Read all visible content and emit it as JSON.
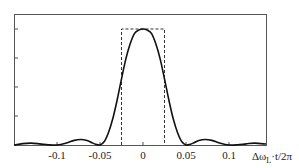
{
  "chart_data": {
    "type": "line",
    "title": "",
    "xlabel": "Δω_L·t/2π",
    "ylabel": "",
    "xlim": [
      -0.15,
      0.143
    ],
    "ylim": [
      0,
      1.15
    ],
    "x_ticks": [
      -0.1,
      -0.05,
      0,
      0.05,
      0.1
    ],
    "x_tick_labels": [
      "-0.1",
      "-0.05",
      "0",
      "0.05",
      "0.1"
    ],
    "y_ticks": [
      0.25,
      0.5,
      0.75,
      1.0
    ],
    "y_tick_labels": [
      "",
      "",
      "",
      ""
    ],
    "grid": false,
    "legend": null,
    "series": [
      {
        "name": "spectrum (sinc²)",
        "style": "solid",
        "color": "#111111",
        "x": [
          -0.15,
          -0.14,
          -0.13,
          -0.12,
          -0.11,
          -0.1,
          -0.09,
          -0.08,
          -0.072,
          -0.065,
          -0.06,
          -0.055,
          -0.05,
          -0.045,
          -0.04,
          -0.035,
          -0.03,
          -0.025,
          -0.02,
          -0.015,
          -0.01,
          -0.005,
          0,
          0.005,
          0.01,
          0.015,
          0.02,
          0.025,
          0.03,
          0.035,
          0.04,
          0.045,
          0.05,
          0.055,
          0.06,
          0.065,
          0.072,
          0.08,
          0.09,
          0.1,
          0.11,
          0.12,
          0.13,
          0.143
        ],
        "y": [
          0.0,
          0.012,
          0.016,
          0.01,
          0.002,
          0.0,
          0.015,
          0.04,
          0.047,
          0.038,
          0.022,
          0.006,
          0.0,
          0.03,
          0.11,
          0.23,
          0.39,
          0.57,
          0.74,
          0.87,
          0.96,
          0.99,
          1.0,
          0.99,
          0.96,
          0.87,
          0.74,
          0.57,
          0.39,
          0.23,
          0.11,
          0.03,
          0.0,
          0.006,
          0.022,
          0.038,
          0.047,
          0.04,
          0.015,
          0.0,
          0.002,
          0.01,
          0.016,
          0.008
        ]
      },
      {
        "name": "rectangular window",
        "style": "dashed",
        "color": "#333333",
        "x": [
          -0.025,
          -0.025,
          0.025,
          0.025
        ],
        "y": [
          0,
          1.0,
          1.0,
          0
        ]
      }
    ]
  }
}
